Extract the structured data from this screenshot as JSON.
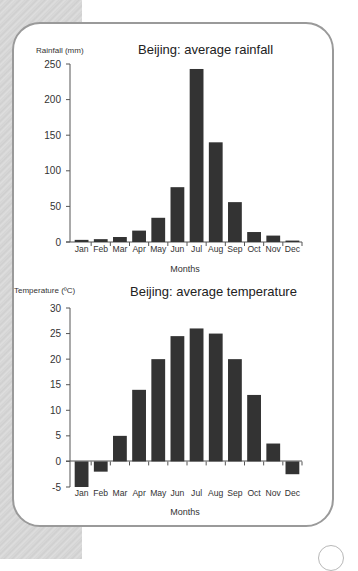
{
  "chart_data": [
    {
      "type": "bar",
      "title": "Beijing: average rainfall",
      "xlabel": "Months",
      "ylabel": "Rainfall (mm)",
      "categories": [
        "Jan",
        "Feb",
        "Mar",
        "Apr",
        "May",
        "Jun",
        "Jul",
        "Aug",
        "Sep",
        "Oct",
        "Nov",
        "Dec"
      ],
      "values": [
        3,
        4,
        7,
        16,
        34,
        77,
        243,
        140,
        56,
        14,
        9,
        2
      ],
      "ylim": [
        0,
        250
      ],
      "yticks": [
        0,
        50,
        100,
        150,
        200,
        250
      ],
      "grid": false,
      "legend": null,
      "bar_color": "#333333"
    },
    {
      "type": "bar",
      "title": "Beijing: average temperature",
      "xlabel": "Months",
      "ylabel": "Temperature (ºC)",
      "categories": [
        "Jan",
        "Feb",
        "Mar",
        "Apr",
        "May",
        "Jun",
        "Jul",
        "Aug",
        "Sep",
        "Oct",
        "Nov",
        "Dec"
      ],
      "values": [
        -5,
        -2,
        5,
        14,
        20,
        24.5,
        26,
        25,
        20,
        13,
        3.5,
        -2.5
      ],
      "ylim": [
        -5,
        30
      ],
      "yticks": [
        -5,
        0,
        5,
        10,
        15,
        20,
        25,
        30
      ],
      "grid": false,
      "legend": null,
      "bar_color": "#333333"
    }
  ],
  "rain": {
    "title": "Beijing: average rainfall",
    "ylabel": "Rainfall (mm)",
    "xlabel": "Months",
    "yticks": [
      "250",
      "200",
      "150",
      "100",
      "50",
      "0"
    ],
    "months": [
      "Jan",
      "Feb",
      "Mar",
      "Apr",
      "May",
      "Jun",
      "Jul",
      "Aug",
      "Sep",
      "Oct",
      "Nov",
      "Dec"
    ]
  },
  "temp": {
    "title": "Beijing: average temperature",
    "ylabel": "Temperature (ºC)",
    "xlabel": "Months",
    "yticks": [
      "30",
      "25",
      "20",
      "15",
      "10",
      "5",
      "0",
      "-5"
    ],
    "months": [
      "Jan",
      "Feb",
      "Mar",
      "Apr",
      "May",
      "Jun",
      "Jul",
      "Aug",
      "Sep",
      "Oct",
      "Nov",
      "Dec"
    ]
  }
}
